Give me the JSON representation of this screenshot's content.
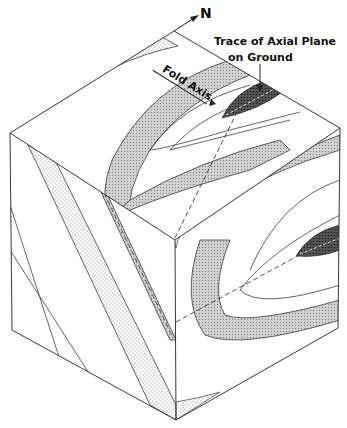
{
  "figure": {
    "type": "block-diagram",
    "labels": {
      "north": "N",
      "trace_line1": "Trace of Axial Plane",
      "trace_line2": "on Ground",
      "fold_axis": "Fold Axis"
    },
    "colors": {
      "background": "#ffffff",
      "line": "#222222",
      "light_stipple": "#e4e4e4",
      "medium_stipple": "#c8c8c8",
      "dark_core": "#4a4a4a"
    }
  }
}
